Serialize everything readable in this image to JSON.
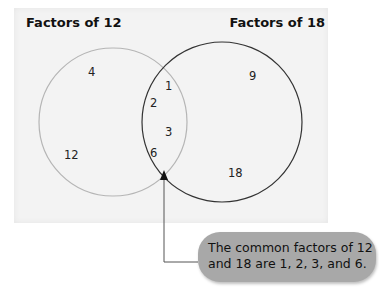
{
  "titles": {
    "left": "Factors of 12",
    "right": "Factors of 18"
  },
  "sets": {
    "left_only": [
      "4",
      "12"
    ],
    "intersection": [
      "1",
      "2",
      "3",
      "6"
    ],
    "right_only": [
      "9",
      "18"
    ]
  },
  "numbers": {
    "n4": "4",
    "n12": "12",
    "n1": "1",
    "n2": "2",
    "n3": "3",
    "n6": "6",
    "n9": "9",
    "n18": "18"
  },
  "callout": {
    "line1": "The common factors of 12",
    "line2": "and 18 are 1, 2, 3, and 6."
  },
  "colors": {
    "panel": "#f3f3f3",
    "left_circle": "#b0b0b0",
    "right_circle": "#333333",
    "callout_bg": "#a8a8a8"
  }
}
